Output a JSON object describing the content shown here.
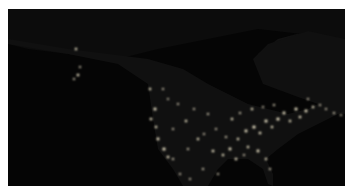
{
  "image": {
    "subject": "North America at night satellite view",
    "colors": {
      "background": "#ffffff",
      "space": "#060606",
      "land": "#111111",
      "ocean": "#050505",
      "lights": "#fff6d8"
    }
  },
  "regions": {
    "land_polygons": [
      "0,0 337,0 337,30 300,22 270,30 250,45 265,70 300,85 320,100 337,105 337,0",
      "0,0 337,0 337,30 250,20 200,30 150,40 110,50 60,45 20,40 0,35",
      "0,35 60,45 110,55 140,75 145,110 150,140 165,160 175,177 200,177 210,160 220,150 240,150 255,160 260,175 265,177 265,165 258,150 270,140 290,125 310,115 330,105 337,100 337,30 300,22 260,35 245,50 255,75 290,88 310,95 300,100 280,105 260,100 240,95 220,85 200,75 175,60 140,50 100,45 60,40 0,30"
    ]
  },
  "light_clusters": [
    {
      "x": 68,
      "y": 40,
      "r": 1.2
    },
    {
      "x": 72,
      "y": 58,
      "r": 1.0
    },
    {
      "x": 70,
      "y": 66,
      "r": 1.3
    },
    {
      "x": 66,
      "y": 70,
      "r": 1.0
    },
    {
      "x": 142,
      "y": 80,
      "r": 1.2
    },
    {
      "x": 147,
      "y": 100,
      "r": 1.5
    },
    {
      "x": 143,
      "y": 110,
      "r": 1.3
    },
    {
      "x": 148,
      "y": 118,
      "r": 1.2
    },
    {
      "x": 150,
      "y": 130,
      "r": 1.4
    },
    {
      "x": 156,
      "y": 140,
      "r": 1.6
    },
    {
      "x": 160,
      "y": 148,
      "r": 1.3
    },
    {
      "x": 165,
      "y": 150,
      "r": 1.1
    },
    {
      "x": 170,
      "y": 95,
      "r": 1.0
    },
    {
      "x": 178,
      "y": 112,
      "r": 1.2
    },
    {
      "x": 190,
      "y": 130,
      "r": 1.2
    },
    {
      "x": 196,
      "y": 125,
      "r": 1.0
    },
    {
      "x": 205,
      "y": 142,
      "r": 1.3
    },
    {
      "x": 215,
      "y": 146,
      "r": 1.2
    },
    {
      "x": 222,
      "y": 140,
      "r": 1.4
    },
    {
      "x": 230,
      "y": 130,
      "r": 1.2
    },
    {
      "x": 238,
      "y": 122,
      "r": 1.4
    },
    {
      "x": 246,
      "y": 118,
      "r": 1.6
    },
    {
      "x": 252,
      "y": 124,
      "r": 1.3
    },
    {
      "x": 258,
      "y": 112,
      "r": 1.5
    },
    {
      "x": 264,
      "y": 118,
      "r": 1.2
    },
    {
      "x": 270,
      "y": 110,
      "r": 1.6
    },
    {
      "x": 276,
      "y": 104,
      "r": 1.4
    },
    {
      "x": 282,
      "y": 112,
      "r": 1.2
    },
    {
      "x": 288,
      "y": 100,
      "r": 1.5
    },
    {
      "x": 292,
      "y": 108,
      "r": 1.3
    },
    {
      "x": 298,
      "y": 102,
      "r": 1.4
    },
    {
      "x": 305,
      "y": 98,
      "r": 1.2
    },
    {
      "x": 312,
      "y": 96,
      "r": 1.0
    },
    {
      "x": 318,
      "y": 100,
      "r": 1.0
    },
    {
      "x": 326,
      "y": 104,
      "r": 1.1
    },
    {
      "x": 333,
      "y": 106,
      "r": 0.9
    },
    {
      "x": 240,
      "y": 138,
      "r": 1.2
    },
    {
      "x": 250,
      "y": 142,
      "r": 1.4
    },
    {
      "x": 258,
      "y": 150,
      "r": 1.2
    },
    {
      "x": 262,
      "y": 160,
      "r": 1.1
    },
    {
      "x": 228,
      "y": 150,
      "r": 1.3
    },
    {
      "x": 236,
      "y": 146,
      "r": 1.0
    },
    {
      "x": 218,
      "y": 128,
      "r": 1.1
    },
    {
      "x": 208,
      "y": 120,
      "r": 1.0
    },
    {
      "x": 200,
      "y": 105,
      "r": 1.1
    },
    {
      "x": 186,
      "y": 100,
      "r": 1.0
    },
    {
      "x": 224,
      "y": 110,
      "r": 1.2
    },
    {
      "x": 232,
      "y": 104,
      "r": 1.1
    },
    {
      "x": 244,
      "y": 100,
      "r": 1.2
    },
    {
      "x": 255,
      "y": 98,
      "r": 1.0
    },
    {
      "x": 266,
      "y": 96,
      "r": 1.1
    },
    {
      "x": 160,
      "y": 90,
      "r": 0.9
    },
    {
      "x": 155,
      "y": 80,
      "r": 1.0
    },
    {
      "x": 165,
      "y": 120,
      "r": 1.0
    },
    {
      "x": 180,
      "y": 140,
      "r": 1.1
    },
    {
      "x": 172,
      "y": 165,
      "r": 1.0
    },
    {
      "x": 182,
      "y": 170,
      "r": 1.0
    },
    {
      "x": 195,
      "y": 160,
      "r": 1.1
    },
    {
      "x": 210,
      "y": 165,
      "r": 1.0
    },
    {
      "x": 300,
      "y": 90,
      "r": 1.0
    }
  ]
}
